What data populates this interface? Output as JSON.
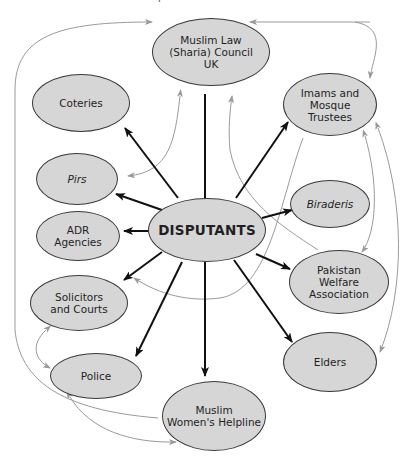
{
  "caption": "Dispute resolution actors",
  "colors": {
    "node_fill": "#d6d6d6",
    "node_border": "#3a3a3a",
    "primary_arrow": "#111111",
    "secondary_arrow": "#9a9a9a"
  },
  "center": {
    "id": "disputants",
    "label": "DISPUTANTS"
  },
  "nodes": [
    {
      "id": "sharia_council",
      "label": "Muslim Law\n(Sharia) Council\nUK",
      "italic": false
    },
    {
      "id": "coteries",
      "label": "Coteries",
      "italic": false
    },
    {
      "id": "imams",
      "label": "Imams and\nMosque\nTrustees",
      "italic": false
    },
    {
      "id": "pirs",
      "label": "Pirs",
      "italic": true
    },
    {
      "id": "biraderis",
      "label": "Biraderis",
      "italic": true
    },
    {
      "id": "adr",
      "label": "ADR\nAgencies",
      "italic": false
    },
    {
      "id": "pwa",
      "label": "Pakistan\nWelfare\nAssociation",
      "italic": false
    },
    {
      "id": "solicitors",
      "label": "Solicitors\nand Courts",
      "italic": false
    },
    {
      "id": "elders",
      "label": "Elders",
      "italic": false
    },
    {
      "id": "police",
      "label": "Police",
      "italic": false
    },
    {
      "id": "mwh",
      "label": "Muslim\nWomen's Helpline",
      "italic": false
    }
  ],
  "primary_edges": [
    {
      "from": "disputants",
      "to": "sharia_council"
    },
    {
      "from": "disputants",
      "to": "coteries"
    },
    {
      "from": "disputants",
      "to": "imams"
    },
    {
      "from": "disputants",
      "to": "pirs"
    },
    {
      "from": "disputants",
      "to": "biraderis"
    },
    {
      "from": "disputants",
      "to": "adr"
    },
    {
      "from": "disputants",
      "to": "pwa"
    },
    {
      "from": "disputants",
      "to": "solicitors"
    },
    {
      "from": "disputants",
      "to": "elders"
    },
    {
      "from": "disputants",
      "to": "police"
    },
    {
      "from": "disputants",
      "to": "mwh"
    }
  ],
  "secondary_edges": [
    {
      "from": "mwh",
      "to": "sharia_council",
      "note": "outer left loop"
    },
    {
      "from": "imams",
      "to": "sharia_council",
      "bidirectional": true
    },
    {
      "from": "sharia_council",
      "to": "pirs",
      "bidirectional": true
    },
    {
      "from": "pwa",
      "to": "sharia_council"
    },
    {
      "from": "imams",
      "to": "pwa",
      "bidirectional": true
    },
    {
      "from": "imams",
      "to": "elders",
      "bidirectional": true
    },
    {
      "from": "imams",
      "to": "solicitors"
    },
    {
      "from": "solicitors",
      "to": "police",
      "bidirectional": true
    },
    {
      "from": "police",
      "to": "mwh",
      "bidirectional": true
    }
  ]
}
